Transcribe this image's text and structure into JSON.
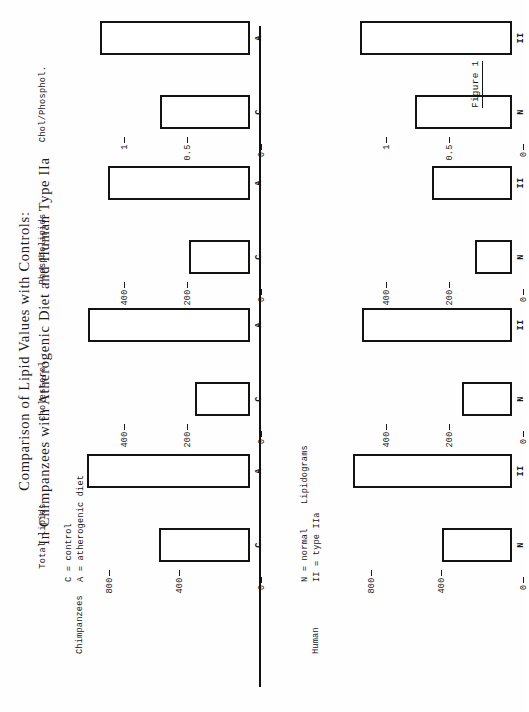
{
  "figure": {
    "title_lines": [
      "Comparison of Lipid Values with Controls:",
      "In Chimpanzees with Atherogenic Diet and Human Type IIa"
    ],
    "caption": "Figure 1"
  },
  "legends": {
    "chimp": {
      "group_label": "Chimpanzees",
      "entries": [
        "C = control",
        "A = atherogenic diet"
      ]
    },
    "human": {
      "group_label": "Human",
      "heading": "Lipidograms",
      "entries": [
        "N = normal",
        "II = type IIa"
      ]
    }
  },
  "chart_data": {
    "type": "bar",
    "title": "Comparison of Lipid Values with Controls: In Chimpanzees with Atherogenic Diet and Human Type IIa",
    "grid": false,
    "legend_position": "left",
    "panels": [
      {
        "name": "Chimpanzees",
        "series_labels": [
          "C",
          "A"
        ],
        "groups": [
          {
            "label": "Total lipids",
            "ylabel": "",
            "ticks": [
              "0",
              "400",
              "800"
            ],
            "tick_values": [
              0,
              400,
              800
            ],
            "ymax": 1000,
            "categories": [
              "C",
              "A"
            ],
            "values": [
              520,
              930
            ]
          },
          {
            "label": "Cholesterol",
            "ylabel": "",
            "ticks": [
              "0",
              "200",
              "400"
            ],
            "tick_values": [
              0,
              200,
              400
            ],
            "ymax": 560,
            "categories": [
              "C",
              "A"
            ],
            "values": [
              175,
              520
            ]
          },
          {
            "label": "Phospholipids",
            "ylabel": "",
            "ticks": [
              "0",
              "200",
              "400"
            ],
            "tick_values": [
              0,
              200,
              400
            ],
            "ymax": 560,
            "categories": [
              "C",
              "A"
            ],
            "values": [
              195,
              455
            ]
          },
          {
            "label": "Chol/Phosphol.",
            "ylabel": "",
            "ticks": [
              "0",
              "0.5",
              "1"
            ],
            "tick_values": [
              0,
              0.5,
              1
            ],
            "ymax": 1.4,
            "categories": [
              "C",
              "A"
            ],
            "values": [
              0.72,
              1.2
            ]
          }
        ]
      },
      {
        "name": "Human",
        "series_labels": [
          "N",
          "II"
        ],
        "groups": [
          {
            "label": "Total lipids",
            "ticks": [
              "0",
              "400",
              "800"
            ],
            "tick_values": [
              0,
              400,
              800
            ],
            "ymax": 1000,
            "categories": [
              "N",
              "II"
            ],
            "values": [
              400,
              910
            ]
          },
          {
            "label": "Cholesterol",
            "ticks": [
              "0",
              "200",
              "400"
            ],
            "tick_values": [
              0,
              200,
              400
            ],
            "ymax": 560,
            "categories": [
              "N",
              "II"
            ],
            "values": [
              160,
              480
            ]
          },
          {
            "label": "Phospholipids",
            "ticks": [
              "0",
              "200",
              "400"
            ],
            "tick_values": [
              0,
              200,
              400
            ],
            "ymax": 560,
            "categories": [
              "N",
              "II"
            ],
            "values": [
              120,
              255
            ]
          },
          {
            "label": "Chol/Phosphol.",
            "ticks": [
              "0",
              "0.5",
              "1"
            ],
            "tick_values": [
              0,
              0.5,
              1
            ],
            "ymax": 1.4,
            "categories": [
              "N",
              "II"
            ],
            "values": [
              0.78,
              1.22
            ]
          }
        ]
      }
    ]
  }
}
